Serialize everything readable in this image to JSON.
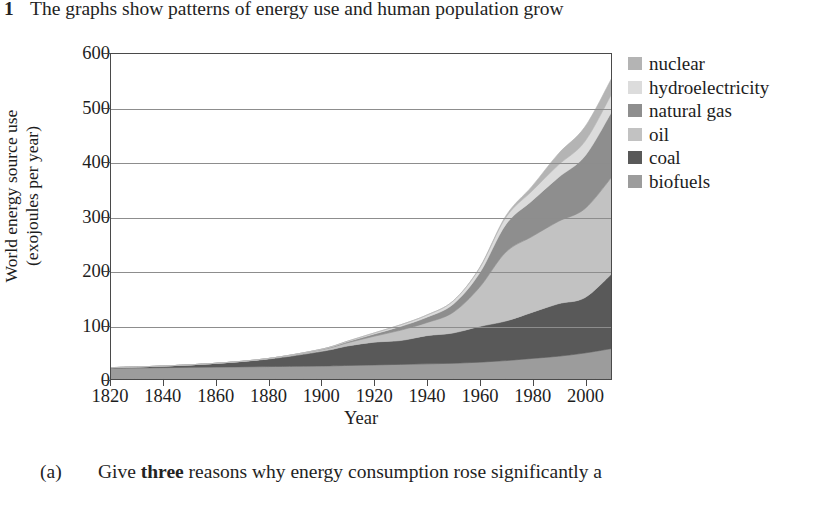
{
  "question_top": {
    "number": "1",
    "text": "The graphs show patterns of energy use and human population grow"
  },
  "question_bottom": {
    "label": "(a)",
    "text_before": "Give ",
    "emphasis": "three",
    "text_after": " reasons why energy consumption rose significantly a"
  },
  "legend": {
    "items": [
      {
        "label": "nuclear",
        "color": "#b4b4b4"
      },
      {
        "label": "hydroelectricity",
        "color": "#dcdcdc"
      },
      {
        "label": "natural gas",
        "color": "#8e8e8e"
      },
      {
        "label": "oil",
        "color": "#c2c2c2"
      },
      {
        "label": "coal",
        "color": "#595959"
      },
      {
        "label": "biofuels",
        "color": "#9c9c9c"
      }
    ]
  },
  "chart_data": {
    "type": "area",
    "title": "",
    "xlabel": "Year",
    "ylabel": "World energy source use (exojoules per year)",
    "ylabel_line1": "World energy source use",
    "ylabel_line2": "(exojoules per year)",
    "xlim": [
      1820,
      2010
    ],
    "ylim": [
      0,
      600
    ],
    "xticks": [
      1820,
      1840,
      1860,
      1880,
      1900,
      1920,
      1940,
      1960,
      1980,
      2000
    ],
    "yticks": [
      0,
      100,
      200,
      300,
      400,
      500,
      600
    ],
    "grid": "horizontal",
    "legend_position": "right",
    "stacked": true,
    "stack_order_bottom_to_top": [
      "biofuels",
      "coal",
      "oil",
      "natural gas",
      "hydroelectricity",
      "nuclear"
    ],
    "x": [
      1820,
      1840,
      1860,
      1880,
      1900,
      1910,
      1920,
      1930,
      1940,
      1950,
      1960,
      1970,
      1980,
      1990,
      2000,
      2010
    ],
    "series": [
      {
        "name": "biofuels",
        "color": "#9c9c9c",
        "values": [
          20,
          21,
          22,
          23,
          24,
          25,
          26,
          27,
          28,
          29,
          31,
          34,
          38,
          42,
          48,
          56
        ]
      },
      {
        "name": "coal",
        "color": "#595959",
        "values": [
          1,
          3,
          7,
          14,
          27,
          36,
          42,
          44,
          52,
          56,
          66,
          73,
          85,
          97,
          102,
          137
        ]
      },
      {
        "name": "oil",
        "color": "#c2c2c2",
        "values": [
          0,
          0,
          0,
          1,
          3,
          6,
          11,
          19,
          24,
          38,
          72,
          127,
          140,
          152,
          164,
          178
        ]
      },
      {
        "name": "natural gas",
        "color": "#8e8e8e",
        "values": [
          0,
          0,
          0,
          0,
          1,
          2,
          4,
          7,
          10,
          15,
          26,
          51,
          66,
          81,
          97,
          120
        ]
      },
      {
        "name": "hydroelectricity",
        "color": "#dcdcdc",
        "values": [
          0,
          0,
          0,
          0,
          0,
          1,
          2,
          3,
          4,
          6,
          9,
          13,
          18,
          23,
          27,
          33
        ]
      },
      {
        "name": "nuclear",
        "color": "#b4b4b4",
        "values": [
          0,
          0,
          0,
          0,
          0,
          0,
          0,
          0,
          0,
          0,
          1,
          3,
          9,
          21,
          27,
          29
        ]
      }
    ],
    "totals": [
      21,
      24,
      29,
      38,
      55,
      70,
      85,
      100,
      118,
      144,
      205,
      301,
      356,
      416,
      465,
      553
    ]
  }
}
